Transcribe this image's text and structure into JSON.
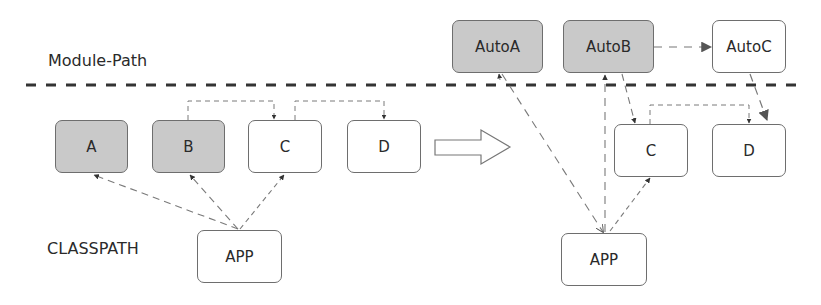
{
  "labels": {
    "module_path": "Module-Path",
    "classpath": "CLASSPATH"
  },
  "before": {
    "boxes": [
      {
        "id": "A",
        "label": "A",
        "fill": "gray"
      },
      {
        "id": "B",
        "label": "B",
        "fill": "gray"
      },
      {
        "id": "C",
        "label": "C",
        "fill": "white"
      },
      {
        "id": "D",
        "label": "D",
        "fill": "white"
      },
      {
        "id": "APP",
        "label": "APP",
        "fill": "white"
      }
    ]
  },
  "after": {
    "boxes": [
      {
        "id": "AutoA",
        "label": "AutoA",
        "fill": "gray"
      },
      {
        "id": "AutoB",
        "label": "AutoB",
        "fill": "gray"
      },
      {
        "id": "AutoC",
        "label": "AutoC",
        "fill": "white"
      },
      {
        "id": "C",
        "label": "C",
        "fill": "white"
      },
      {
        "id": "D",
        "label": "D",
        "fill": "white"
      },
      {
        "id": "APP",
        "label": "APP",
        "fill": "white"
      }
    ]
  },
  "colors": {
    "gray_fill": "#c9c9c9",
    "border": "#6e6e6e",
    "dashed_line": "#333333",
    "connector": "#7a7a7a"
  },
  "transition_arrow": "right-outline-arrow"
}
